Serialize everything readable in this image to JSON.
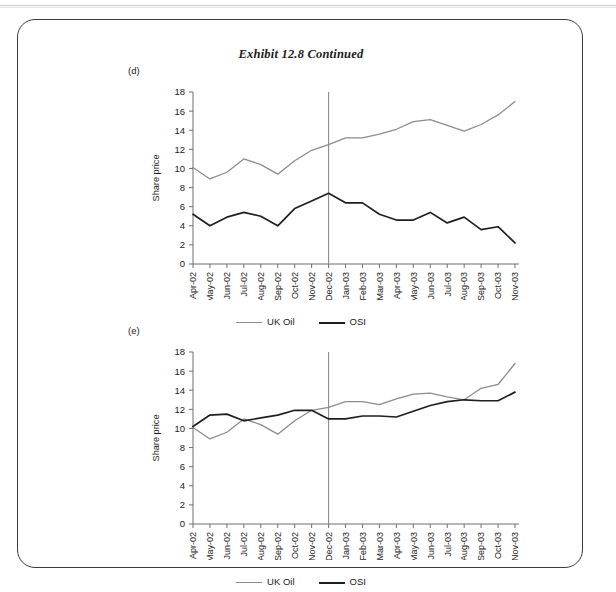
{
  "exhibit": {
    "title": "Exhibit 12.8  Continued"
  },
  "panels": [
    {
      "id": "d",
      "label": "(d)",
      "ylabel": "Share price",
      "legend": [
        {
          "name": "UK Oil",
          "color": "#8c8c8c"
        },
        {
          "name": "OSI",
          "color": "#1f1f1f"
        }
      ]
    },
    {
      "id": "e",
      "label": "(e)",
      "ylabel": "Share price",
      "legend": [
        {
          "name": "UK Oil",
          "color": "#8c8c8c"
        },
        {
          "name": "OSI",
          "color": "#1f1f1f"
        }
      ]
    }
  ],
  "chart_data": [
    {
      "type": "line",
      "panel": "d",
      "title": "",
      "xlabel": "",
      "ylabel": "Share price",
      "ylim": [
        0,
        18
      ],
      "yticks": [
        0,
        2,
        4,
        6,
        8,
        10,
        12,
        14,
        16,
        18
      ],
      "ytick_labels": [
        "0",
        "2",
        "4",
        "6",
        "8",
        "10",
        "12",
        "14",
        "16",
        "18"
      ],
      "grid": false,
      "legend_position": "bottom",
      "annotations": [
        {
          "type": "vline",
          "x": "Dec-02",
          "color": "#8c8c8c",
          "label": ""
        }
      ],
      "categories": [
        "Apr-02",
        "May-02",
        "Jun-02",
        "Jul-02",
        "Aug-02",
        "Sep-02",
        "Oct-02",
        "Nov-02",
        "Dec-02",
        "Jan-03",
        "Feb-03",
        "Mar-03",
        "Apr-03",
        "May-03",
        "Jun-03",
        "Jul-03",
        "Aug-03",
        "Sep-03",
        "Oct-03",
        "Nov-03"
      ],
      "series": [
        {
          "name": "UK Oil",
          "color": "#8c8c8c",
          "values": [
            10.1,
            8.9,
            9.6,
            11.0,
            10.4,
            9.4,
            10.8,
            11.9,
            12.5,
            13.2,
            13.2,
            13.6,
            14.1,
            14.9,
            15.1,
            14.5,
            13.9,
            14.6,
            15.6,
            17.0
          ]
        },
        {
          "name": "OSI",
          "color": "#1f1f1f",
          "values": [
            5.2,
            4.0,
            4.9,
            5.4,
            5.0,
            4.0,
            5.8,
            6.6,
            7.4,
            6.4,
            6.4,
            5.2,
            4.6,
            4.6,
            5.4,
            4.3,
            4.9,
            3.6,
            3.9,
            2.2
          ]
        }
      ]
    },
    {
      "type": "line",
      "panel": "e",
      "title": "",
      "xlabel": "",
      "ylabel": "Share price",
      "ylim": [
        0,
        18
      ],
      "yticks": [
        0,
        2,
        4,
        6,
        8,
        10,
        12,
        14,
        16,
        18
      ],
      "ytick_labels": [
        "0",
        "2",
        "4",
        "6",
        "8",
        "10",
        "12",
        "14",
        "16",
        "18"
      ],
      "grid": false,
      "legend_position": "bottom",
      "annotations": [
        {
          "type": "vline",
          "x": "Dec-02",
          "color": "#8c8c8c",
          "label": ""
        }
      ],
      "categories": [
        "Apr-02",
        "May-02",
        "Jun-02",
        "Jul-02",
        "Aug-02",
        "Sep-02",
        "Oct-02",
        "Nov-02",
        "Dec-02",
        "Jan-03",
        "Feb-03",
        "Mar-03",
        "Apr-03",
        "May-03",
        "Jun-03",
        "Jul-03",
        "Aug-03",
        "Sep-03",
        "Oct-03",
        "Nov-03"
      ],
      "series": [
        {
          "name": "UK Oil",
          "color": "#8c8c8c",
          "values": [
            10.1,
            8.9,
            9.6,
            11.0,
            10.4,
            9.4,
            10.8,
            11.9,
            12.2,
            12.8,
            12.8,
            12.5,
            13.1,
            13.6,
            13.7,
            13.3,
            13.0,
            14.2,
            14.6,
            16.8
          ]
        },
        {
          "name": "OSI",
          "color": "#1f1f1f",
          "values": [
            10.2,
            11.4,
            11.5,
            10.8,
            11.1,
            11.4,
            11.9,
            11.9,
            11.0,
            11.0,
            11.3,
            11.3,
            11.2,
            11.8,
            12.4,
            12.8,
            13.0,
            12.9,
            12.9,
            13.8
          ]
        }
      ]
    }
  ]
}
